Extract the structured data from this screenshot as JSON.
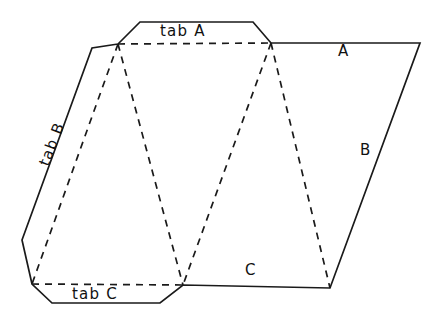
{
  "figure": {
    "canvas": {
      "width": 441,
      "height": 327
    },
    "colors": {
      "background": "#ffffff",
      "stroke": "#1a1a1a",
      "text": "#111111"
    }
  },
  "labels": {
    "tab_a": "tab A",
    "tab_b": "tab B",
    "tab_c": "tab C",
    "face_a": "A",
    "face_b": "B",
    "face_c": "C"
  },
  "geometry": {
    "solid_outline": "118,44 140,22 253,22 271,43 420,43 330,288 183,285 160,303 52,303 32,284 22,240 92,48 118,44",
    "fold_tab_a": "118,44 271,43",
    "fold_tab_b": "118,44 32,284",
    "fold_tab_c": "32,284 183,285",
    "fold_left_triangle": "118,44 183,285",
    "fold_right_triangle_left": "271,43 183,285",
    "fold_right_triangle_right": "271,43 330,288"
  }
}
